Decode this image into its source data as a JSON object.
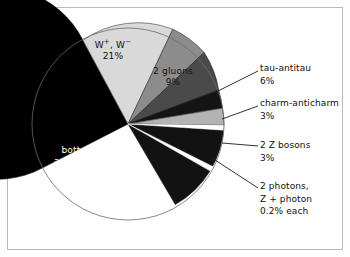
{
  "figure": {
    "background": "#ffffff",
    "frame_color": "#b9b9b9"
  },
  "chart_data": {
    "type": "pie",
    "title": "",
    "legend_position": "callouts-right",
    "categories": [
      "W+, W-",
      "2 gluons",
      "tau-antitau",
      "charm-anticharm",
      "2 Z bosons",
      "2 photons",
      "Z + photon",
      "bottom-antibottom"
    ],
    "values": [
      21,
      9,
      6,
      3,
      3,
      0.2,
      0.2,
      57
    ],
    "value_labels": [
      "21%",
      "9%",
      "6%",
      "3%",
      "3%",
      "0.2%",
      "0.2%",
      "57%"
    ],
    "colors": [
      "#d9d9d9",
      "#8c8c8c",
      "#4a4a4a",
      "#111111",
      "#b3b3b3",
      "#ffffff",
      "#ffffff",
      "#000000"
    ],
    "xlabel": "",
    "ylabel": ""
  },
  "inner_labels": [
    {
      "name": "w-bosons",
      "line1_html": "W<sup>+</sup>, W<sup>&minus;</sup>",
      "line2": "21%"
    },
    {
      "name": "gluons",
      "line1": "2 gluons",
      "line2": "9%"
    },
    {
      "name": "bottom",
      "line1": "bottom-",
      "line2": "antibottom",
      "line3": "57%"
    }
  ],
  "callouts": [
    {
      "name": "tau-antitau",
      "line1": "tau-antitau",
      "line2": "6%"
    },
    {
      "name": "charm-anticharm",
      "line1": "charm-anticharm",
      "line2": "3%"
    },
    {
      "name": "z-bosons",
      "line1": "2 Z bosons",
      "line2": "3%"
    },
    {
      "name": "photons",
      "line1": "2 photons,",
      "line2": "Z + photon",
      "line3": "0.2% each"
    }
  ]
}
